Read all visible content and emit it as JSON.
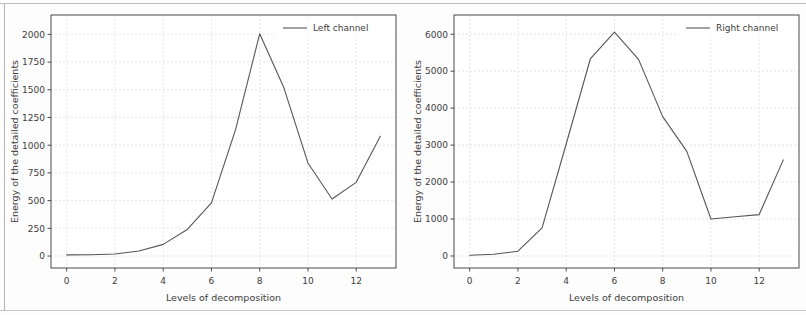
{
  "figure": {
    "background_color": "#fdfdfd",
    "frame_color": "#bdbdbd",
    "line_color": "#555555",
    "grid_color": "#dedede",
    "axis_color": "#4a4a4a",
    "text_color": "#3c3c3c"
  },
  "panels": [
    {
      "id": "left-channel-panel",
      "legend_label": "Left channel",
      "xlabel": "Levels of decomposition",
      "ylabel": "Energy of the detailed coefficients",
      "xticks": [
        "0",
        "2",
        "4",
        "6",
        "8",
        "10",
        "12"
      ],
      "yticks": [
        "0",
        "250",
        "500",
        "750",
        "1000",
        "1250",
        "1500",
        "1750",
        "2000"
      ]
    },
    {
      "id": "right-channel-panel",
      "legend_label": "Right channel",
      "xlabel": "Levels of decomposition",
      "ylabel": "Energy of the detailed coefficients",
      "xticks": [
        "0",
        "2",
        "4",
        "6",
        "8",
        "10",
        "12"
      ],
      "yticks": [
        "0",
        "1000",
        "2000",
        "3000",
        "4000",
        "5000",
        "6000"
      ]
    }
  ],
  "chart_data": [
    {
      "type": "line",
      "title": "",
      "xlabel": "Levels of decomposition",
      "ylabel": "Energy of the detailed coefficients",
      "legend_position": "upper right",
      "grid": true,
      "xlim": [
        -0.65,
        13.65
      ],
      "ylim": [
        -108,
        2175
      ],
      "xticks": [
        0,
        2,
        4,
        6,
        8,
        10,
        12
      ],
      "yticks": [
        0,
        250,
        500,
        750,
        1000,
        1250,
        1500,
        1750,
        2000
      ],
      "series": [
        {
          "name": "Left channel",
          "x": [
            0,
            1,
            2,
            3,
            4,
            5,
            6,
            7,
            8,
            9,
            10,
            11,
            12,
            13
          ],
          "values": [
            10,
            12,
            18,
            45,
            105,
            240,
            480,
            1140,
            2005,
            1520,
            840,
            515,
            665,
            1080
          ]
        }
      ]
    },
    {
      "type": "line",
      "title": "",
      "xlabel": "Levels of decomposition",
      "ylabel": "Energy of the detailed coefficients",
      "legend_position": "upper right",
      "grid": true,
      "xlim": [
        -0.65,
        13.65
      ],
      "ylim": [
        -325,
        6520
      ],
      "xticks": [
        0,
        2,
        4,
        6,
        8,
        10,
        12
      ],
      "yticks": [
        0,
        1000,
        2000,
        3000,
        4000,
        5000,
        6000
      ],
      "series": [
        {
          "name": "Right channel",
          "x": [
            0,
            1,
            2,
            3,
            4,
            5,
            6,
            7,
            8,
            9,
            10,
            11,
            12,
            13
          ],
          "values": [
            20,
            45,
            130,
            760,
            3030,
            5330,
            6055,
            5320,
            3770,
            2830,
            1000,
            1060,
            1120,
            2600
          ]
        }
      ]
    }
  ]
}
